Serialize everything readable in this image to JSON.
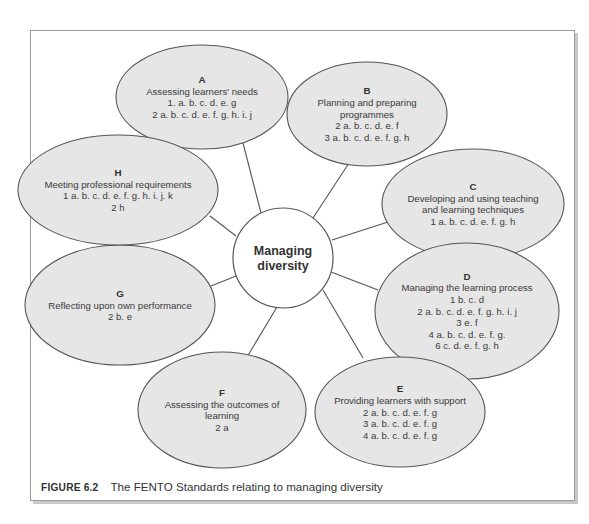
{
  "center": {
    "lines": [
      "Managing",
      "diversity"
    ],
    "cx": 283,
    "cy": 258,
    "r": 50
  },
  "nodes": [
    {
      "id": "A",
      "letter": "A",
      "title_lines": [
        "Assessing learners' needs"
      ],
      "items": [
        "1. a. b. c. d. e.  g",
        "2 a. b. c. d. e. f. g. h. i. j"
      ],
      "cx": 202,
      "cy": 97,
      "rx": 86,
      "ry": 52
    },
    {
      "id": "B",
      "letter": "B",
      "title_lines": [
        "Planning and preparing",
        "programmes"
      ],
      "items": [
        "2 a. b. c. d. e. f",
        "3 a. b. c. d. e. f. g. h"
      ],
      "cx": 367,
      "cy": 114,
      "rx": 80,
      "ry": 52
    },
    {
      "id": "C",
      "letter": "C",
      "title_lines": [
        "Developing and using teaching",
        "and learning techniques"
      ],
      "items": [
        "1 a. b. c. d. e. f. g. h"
      ],
      "cx": 473,
      "cy": 204,
      "rx": 91,
      "ry": 55
    },
    {
      "id": "D",
      "letter": "D",
      "title_lines": [
        "Managing the learning process"
      ],
      "items": [
        "1 b. c. d",
        "2 a. b. c. d. e. f. g. h. i. j",
        "3 e. f",
        "4 a. b. c. d. e. f. g.",
        "6 c. d. e. f. g. h"
      ],
      "cx": 467,
      "cy": 311,
      "rx": 92,
      "ry": 68
    },
    {
      "id": "E",
      "letter": "E",
      "title_lines": [
        "Providing learners with support"
      ],
      "items": [
        "2 a. b. c. d. e. f. g",
        "3 a. b. c. d. e. f. g",
        "4 a. b. c. d. e. f. g"
      ],
      "cx": 400,
      "cy": 412,
      "rx": 85,
      "ry": 55
    },
    {
      "id": "F",
      "letter": "F",
      "title_lines": [
        "Assessing the outcomes of",
        "learning"
      ],
      "items": [
        "2 a"
      ],
      "cx": 222,
      "cy": 410,
      "rx": 84,
      "ry": 58
    },
    {
      "id": "G",
      "letter": "G",
      "title_lines": [
        "Reflecting upon own performance"
      ],
      "items": [
        "2 b. e"
      ],
      "cx": 120,
      "cy": 305,
      "rx": 95,
      "ry": 60
    },
    {
      "id": "H",
      "letter": "H",
      "title_lines": [
        "Meeting professional requirements"
      ],
      "items": [
        "1 a. b. c. d. e. f. g. h. i. j. k",
        "2 h"
      ],
      "cx": 118,
      "cy": 190,
      "rx": 100,
      "ry": 55
    }
  ],
  "spokes": [
    {
      "to": "A",
      "x1": 261,
      "y1": 213,
      "x2": 243,
      "y2": 143
    },
    {
      "to": "B",
      "x1": 313,
      "y1": 218,
      "x2": 349,
      "y2": 163
    },
    {
      "to": "C",
      "x1": 332,
      "y1": 240,
      "x2": 388,
      "y2": 222
    },
    {
      "to": "D",
      "x1": 331,
      "y1": 272,
      "x2": 378,
      "y2": 290
    },
    {
      "to": "E",
      "x1": 323,
      "y1": 290,
      "x2": 363,
      "y2": 358
    },
    {
      "to": "F",
      "x1": 277,
      "y1": 307,
      "x2": 244,
      "y2": 362
    },
    {
      "to": "G",
      "x1": 236,
      "y1": 276,
      "x2": 191,
      "y2": 294
    },
    {
      "to": "H",
      "x1": 236,
      "y1": 236,
      "x2": 210,
      "y2": 216
    }
  ],
  "caption": {
    "label": "FIGURE 6.2",
    "text": "The FENTO Standards relating to managing diversity"
  },
  "colors": {
    "ellipse_fill": "#e6e6e6",
    "stroke": "#555555",
    "text": "#3a3a3a"
  }
}
